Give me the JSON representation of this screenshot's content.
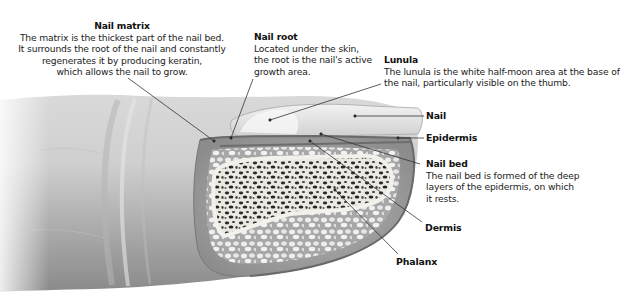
{
  "diagram": {
    "labels": {
      "nail_matrix": {
        "title": "Nail matrix",
        "lines": [
          "The matrix is the thickest part of the nail bed.",
          "It surrounds the root of the nail and constantly",
          "regenerates it by producing keratin,",
          "which allows the nail to grow."
        ]
      },
      "nail_root": {
        "title": "Nail root",
        "lines": [
          "Located under the skin,",
          "the root is the nail's active",
          "growth area."
        ]
      },
      "lunula": {
        "title": "Lunula",
        "lines": [
          "The lunula is the white half-moon area at the base of",
          "the nail, particularly visible on the thumb."
        ]
      },
      "nail": {
        "title": "Nail"
      },
      "epidermis": {
        "title": "Epidermis"
      },
      "nail_bed": {
        "title": "Nail bed",
        "lines": [
          "The nail bed is formed of the deep",
          "layers of the epidermis, on which",
          "it rests."
        ]
      },
      "dermis": {
        "title": "Dermis"
      },
      "phalanx": {
        "title": "Phalanx"
      }
    },
    "colors": {
      "background": "#ffffff",
      "skin_light": "#e4e4e4",
      "skin_mid": "#c8c8c8",
      "skin_dark": "#8e8e8e",
      "bone": "#efece6",
      "marrow": "#2a2a2a",
      "leader_line": "#333333"
    }
  }
}
